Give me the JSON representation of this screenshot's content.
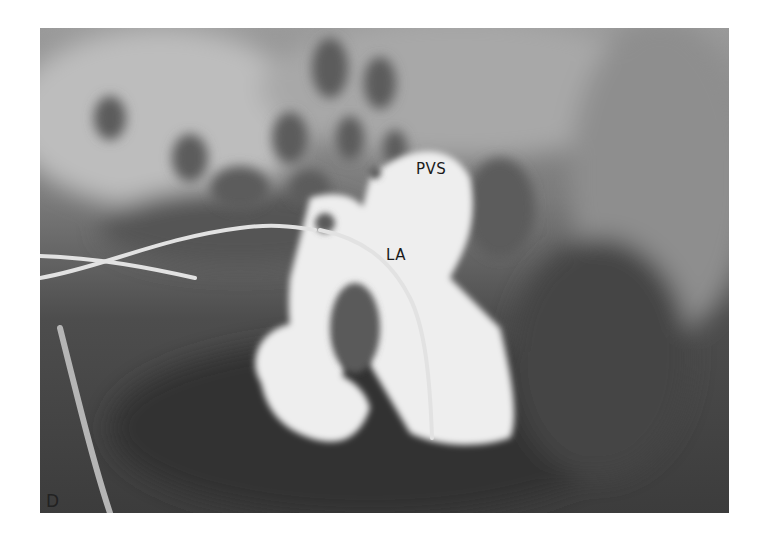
{
  "figure": {
    "panel_label": "D",
    "annotations": [
      {
        "id": "pvs",
        "text": "PVS"
      },
      {
        "id": "la",
        "text": "LA"
      }
    ]
  }
}
